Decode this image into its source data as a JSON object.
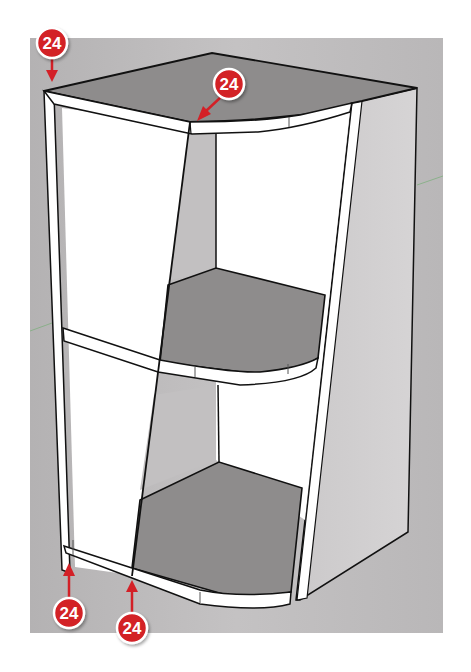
{
  "figure": {
    "colors": {
      "background_panel": "#b9b7b8",
      "shelf_top": "#8e8c8c",
      "white_panel": "#ffffff",
      "side_panel": "#cfcdce",
      "outline": "#111111",
      "badge_fill": "#d32027",
      "badge_ring": "#ffffff",
      "arrow": "#d32027"
    },
    "callouts": [
      {
        "id": "callout-top-left",
        "label": "24",
        "target": "top-left-corner-edge"
      },
      {
        "id": "callout-top-front",
        "label": "24",
        "target": "top-curved-front-edge"
      },
      {
        "id": "callout-bottom-left",
        "label": "24",
        "target": "bottom-left-edge"
      },
      {
        "id": "callout-bottom-front",
        "label": "24",
        "target": "bottom-shelf-front-edge"
      }
    ]
  }
}
